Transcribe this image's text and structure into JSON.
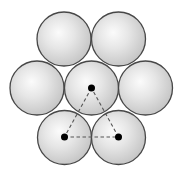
{
  "diagram": {
    "radius": 27,
    "colors": {
      "background": "#ffffff",
      "outline": "#474747",
      "highlight": "#fbfbfb",
      "shade": "#c4c4c4",
      "dot": "#000000",
      "dash": "#555555"
    },
    "circles": [
      {
        "id": "top-left",
        "cx": 64,
        "cy": 39
      },
      {
        "id": "top-right",
        "cx": 118.5,
        "cy": 39
      },
      {
        "id": "middle-left",
        "cx": 37,
        "cy": 88
      },
      {
        "id": "center",
        "cx": 91.5,
        "cy": 88
      },
      {
        "id": "middle-right",
        "cx": 145.5,
        "cy": 88
      },
      {
        "id": "bottom-left",
        "cx": 64.5,
        "cy": 137.5
      },
      {
        "id": "bottom-right",
        "cx": 118.5,
        "cy": 137.5
      }
    ],
    "center_dots": [
      {
        "id": "center",
        "cx": 91.5,
        "cy": 88
      },
      {
        "id": "bottom-left",
        "cx": 64.5,
        "cy": 137
      },
      {
        "id": "bottom-right",
        "cx": 118.5,
        "cy": 137
      }
    ],
    "dot_radius": 3.5,
    "triangle": {
      "style": "dashed",
      "points": [
        [
          91.5,
          88
        ],
        [
          64.5,
          137
        ],
        [
          118.5,
          137
        ]
      ]
    }
  }
}
